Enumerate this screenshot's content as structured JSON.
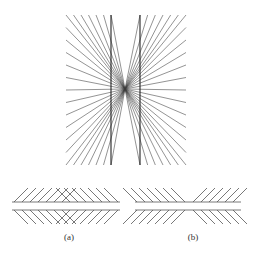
{
  "figure": {
    "stroke_color": "#3a3a3a",
    "line_color": "#555555",
    "top": {
      "center": [
        125,
        89
      ],
      "top_y": 15,
      "bottom_y": 165,
      "left_x": 66,
      "right_x": 186,
      "inner_left_x": 111,
      "inner_right_x": 140,
      "spokes_per_side": 25
    },
    "panels": [
      {
        "label": "(a)",
        "x0": 12,
        "x1": 120,
        "apex_x": 69,
        "pattern": "converging"
      },
      {
        "label": "(b)",
        "x0": 135,
        "x1": 241,
        "apex_x": 190,
        "pattern": "crossing"
      }
    ],
    "bottom": {
      "line_top_y": 202,
      "line_bottom_y": 210,
      "diag_len": 14,
      "spacing": 8
    }
  }
}
